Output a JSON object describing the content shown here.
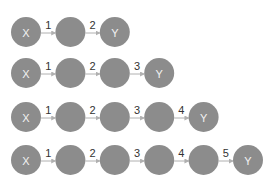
{
  "diagram": {
    "colors": {
      "node": "#8c8c8c",
      "node_text": "#f2f2f2",
      "edge": "#b0b0b0",
      "edge_label": "#333333"
    },
    "layout": {
      "x_start": 26,
      "x_spacing": 44.4,
      "radius": 15
    },
    "rows": [
      {
        "y": 32,
        "nodes": [
          "X",
          "",
          "Y"
        ],
        "edges": [
          "1",
          "2"
        ]
      },
      {
        "y": 73,
        "nodes": [
          "X",
          "",
          "",
          "Y"
        ],
        "edges": [
          "1",
          "2",
          "3"
        ]
      },
      {
        "y": 117,
        "nodes": [
          "X",
          "",
          "",
          "",
          "Y"
        ],
        "edges": [
          "1",
          "2",
          "3",
          "4"
        ]
      },
      {
        "y": 160,
        "nodes": [
          "X",
          "",
          "",
          "",
          "",
          "Y"
        ],
        "edges": [
          "1",
          "2",
          "3",
          "4",
          "5"
        ]
      }
    ]
  }
}
